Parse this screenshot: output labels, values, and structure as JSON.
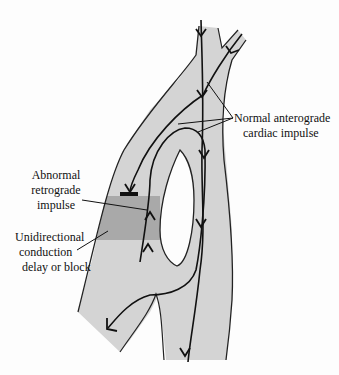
{
  "diagram": {
    "colors": {
      "tissue": "#d4d4d4",
      "block_zone": "#a9a9a9",
      "outline": "#222222",
      "background": "#fdfdfd"
    },
    "labels": {
      "normal": {
        "line1": "Normal anterograde",
        "line2": "cardiac impulse"
      },
      "abnormal": {
        "line1": "Abnormal",
        "line2": "retrograde",
        "line3": "impulse"
      },
      "block": {
        "line1": "Unidirectional",
        "line2": "conduction",
        "line3": "delay or block"
      }
    }
  }
}
